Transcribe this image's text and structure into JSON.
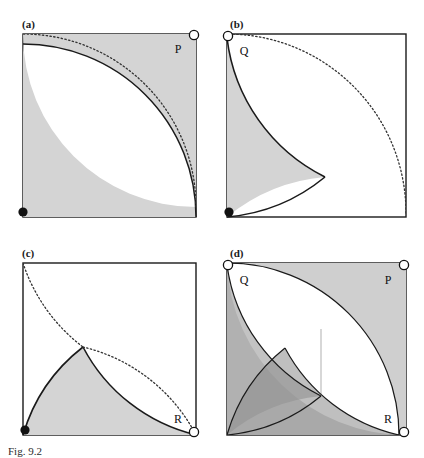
{
  "figure": {
    "caption": "Fig. 9.2",
    "panels": [
      {
        "id": "a",
        "label": "(a)",
        "vertices": [
          {
            "name": "P",
            "label": "P",
            "marker": "open-circle",
            "corner": "top-right"
          },
          {
            "name": "origin",
            "label": "",
            "marker": "filled-dot",
            "corner": "bottom-left"
          }
        ],
        "shaded_regions": 1
      },
      {
        "id": "b",
        "label": "(b)",
        "vertices": [
          {
            "name": "Q",
            "label": "Q",
            "marker": "open-circle",
            "corner": "top-left"
          },
          {
            "name": "origin",
            "label": "",
            "marker": "filled-dot",
            "corner": "bottom-left"
          }
        ],
        "shaded_regions": 1
      },
      {
        "id": "c",
        "label": "(c)",
        "vertices": [
          {
            "name": "R",
            "label": "R",
            "marker": "open-circle",
            "corner": "bottom-right"
          },
          {
            "name": "origin",
            "label": "",
            "marker": "filled-dot",
            "corner": "bottom-left"
          }
        ],
        "shaded_regions": 1
      },
      {
        "id": "d",
        "label": "(d)",
        "vertices": [
          {
            "name": "Q",
            "label": "Q",
            "marker": "open-circle",
            "corner": "top-left"
          },
          {
            "name": "P",
            "label": "P",
            "marker": "open-circle",
            "corner": "top-right"
          },
          {
            "name": "R",
            "label": "R",
            "marker": "open-circle",
            "corner": "bottom-right"
          }
        ],
        "shaded_regions": 3
      }
    ],
    "colors": {
      "stroke": "#1a1a1a",
      "shade_light": "#d4d4d4",
      "shade_medium": "#a9a9a9",
      "shade_dark": "#787878",
      "background": "#ffffff",
      "dotted": "#3a3a3a"
    }
  }
}
